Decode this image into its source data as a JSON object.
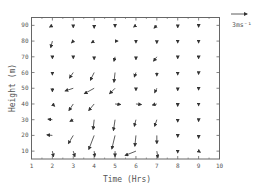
{
  "chart_data": {
    "type": "quiver",
    "title": "",
    "xlabel": "Time (Hrs)",
    "ylabel": "Height (m)",
    "xlim": [
      1,
      10
    ],
    "ylim": [
      5,
      95
    ],
    "xticks": [
      1,
      2,
      3,
      4,
      5,
      6,
      7,
      8,
      9,
      10
    ],
    "yticks": [
      10,
      20,
      30,
      40,
      50,
      60,
      70,
      80,
      90
    ],
    "grid": false,
    "reference_vector": {
      "label": "3ms⁻¹",
      "magnitude": 3,
      "u": 3,
      "v": 0
    },
    "x": [
      2,
      3,
      4,
      5,
      6,
      7,
      8,
      9
    ],
    "y": [
      90,
      80,
      70,
      60,
      50,
      40,
      30,
      20,
      10
    ],
    "vectors": [
      {
        "y": 90,
        "u": [
          -0.5,
          0,
          0,
          0,
          -0.4,
          -0.5,
          0,
          0
        ],
        "v": [
          -0.3,
          -0.4,
          -0.5,
          -0.3,
          -0.3,
          -0.5,
          -0.4,
          -0.3
        ]
      },
      {
        "y": 80,
        "u": [
          -0.3,
          -0.3,
          -0.5,
          0.5,
          0,
          0,
          0,
          0
        ],
        "v": [
          -1.2,
          -0.3,
          -0.3,
          0,
          -0.3,
          -0.4,
          -0.3,
          -0.3
        ]
      },
      {
        "y": 70,
        "u": [
          0,
          0,
          0,
          -0.2,
          0,
          -0.6,
          0,
          0
        ],
        "v": [
          -0.3,
          -0.3,
          -0.5,
          -0.8,
          -0.5,
          -0.8,
          -0.3,
          -0.3
        ]
      },
      {
        "y": 60,
        "u": [
          0,
          -0.7,
          -0.7,
          -0.2,
          -0.3,
          0,
          0,
          0
        ],
        "v": [
          -0.4,
          -1.0,
          -1.4,
          -1.8,
          -0.8,
          -0.6,
          -0.4,
          -0.3
        ]
      },
      {
        "y": 50,
        "u": [
          0,
          -1.5,
          -1.8,
          -1.0,
          0,
          -0.4,
          0,
          0
        ],
        "v": [
          -0.6,
          -0.5,
          -1.0,
          -1.0,
          -0.4,
          -0.8,
          -0.4,
          -0.3
        ]
      },
      {
        "y": 40,
        "u": [
          0.4,
          -0.8,
          -1.0,
          1.0,
          1.0,
          -0.8,
          0,
          0
        ],
        "v": [
          -0.4,
          -1.2,
          -1.2,
          -0.1,
          -0.1,
          -0.2,
          -0.4,
          -0.3
        ]
      },
      {
        "y": 30,
        "u": [
          -0.8,
          -0.6,
          -0.2,
          -0.3,
          -0.3,
          -0.4,
          0,
          0
        ],
        "v": [
          0.1,
          -0.3,
          -1.8,
          -2.0,
          -1.2,
          -1.2,
          -0.4,
          -0.3
        ]
      },
      {
        "y": 20,
        "u": [
          -1.0,
          -0.9,
          -1.0,
          -0.6,
          -0.2,
          0,
          0,
          0
        ],
        "v": [
          0.1,
          -1.5,
          -2.6,
          -2.5,
          -2.0,
          -1.5,
          -0.3,
          -0.5
        ]
      },
      {
        "y": 10,
        "u": [
          0.2,
          0.3,
          0.1,
          0,
          -2.0,
          0.2,
          0,
          0.3
        ],
        "v": [
          -1.0,
          -1.0,
          -1.0,
          -1.0,
          -0.8,
          -1.2,
          -0.3,
          -0.2
        ]
      }
    ]
  },
  "labels": {
    "xlabel": "Time (Hrs)",
    "ylabel": "Height (m)",
    "ref": "3ms⁻¹"
  },
  "colors": {
    "axis": "#555555",
    "arrow": "#333333"
  }
}
